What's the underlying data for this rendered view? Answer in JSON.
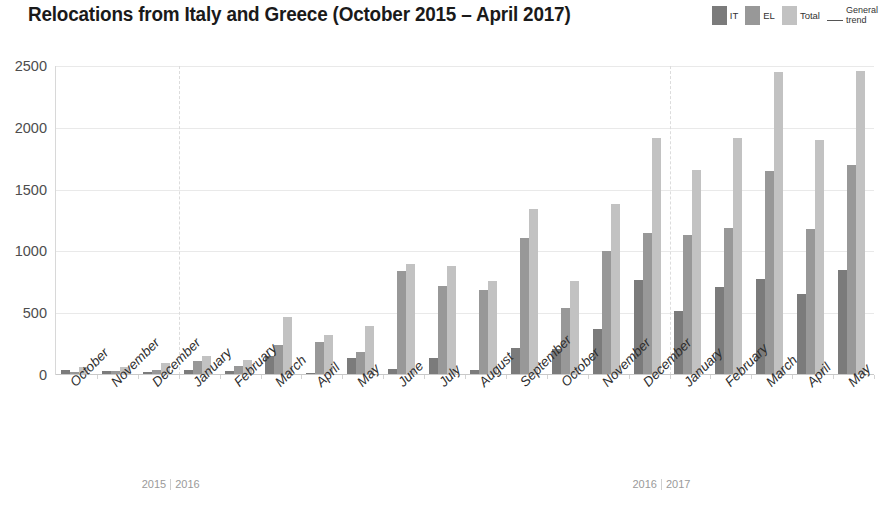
{
  "header": {
    "title": "Relocations from Italy and Greece (October 2015 – April 2017)"
  },
  "legend": {
    "items": [
      {
        "label": "IT",
        "color": "#7b7b7b",
        "type": "swatch"
      },
      {
        "label": "EL",
        "color": "#989898",
        "type": "swatch"
      },
      {
        "label": "Total",
        "color": "#c2c2c2",
        "type": "swatch"
      },
      {
        "label_line1": "General",
        "label_line2": "trend",
        "color": "#555555",
        "type": "line"
      }
    ]
  },
  "year_markers": [
    {
      "left": "2015",
      "right": "2016",
      "after_category_index": 2
    },
    {
      "left": "2016",
      "right": "2017",
      "after_category_index": 14
    }
  ],
  "chart_data": {
    "type": "bar",
    "title": "Relocations from Italy and Greece (October 2015 – April 2017)",
    "xlabel": "",
    "ylabel": "",
    "ylim": [
      0,
      2500
    ],
    "yticks": [
      0,
      500,
      1000,
      1500,
      2000,
      2500
    ],
    "grid": true,
    "legend_position": "top-right",
    "categories": [
      "October",
      "November",
      "December",
      "January",
      "February",
      "March",
      "April",
      "May",
      "June",
      "July",
      "August",
      "September",
      "October",
      "November",
      "December",
      "January",
      "February",
      "March",
      "April",
      "May"
    ],
    "category_years": [
      "2015",
      "2015",
      "2015",
      "2016",
      "2016",
      "2016",
      "2016",
      "2016",
      "2016",
      "2016",
      "2016",
      "2016",
      "2016",
      "2016",
      "2016",
      "2017",
      "2017",
      "2017",
      "2017",
      "2017"
    ],
    "series": [
      {
        "name": "IT",
        "color": "#7b7b7b",
        "values": [
          40,
          30,
          25,
          40,
          35,
          150,
          20,
          140,
          50,
          140,
          40,
          215,
          210,
          370,
          765,
          520,
          710,
          775,
          655,
          850
        ]
      },
      {
        "name": "EL",
        "color": "#989898",
        "values": [
          25,
          35,
          40,
          110,
          70,
          240,
          270,
          190,
          845,
          720,
          690,
          1110,
          540,
          1000,
          1145,
          1130,
          1190,
          1650,
          1185,
          1700
        ]
      },
      {
        "name": "Total",
        "color": "#c2c2c2",
        "values": [
          65,
          65,
          95,
          150,
          120,
          470,
          320,
          395,
          895,
          880,
          760,
          1345,
          760,
          1385,
          1920,
          1655,
          1920,
          2450,
          1905,
          2460
        ]
      }
    ],
    "trend": {
      "name": "General trend",
      "color": "#555555"
    }
  }
}
